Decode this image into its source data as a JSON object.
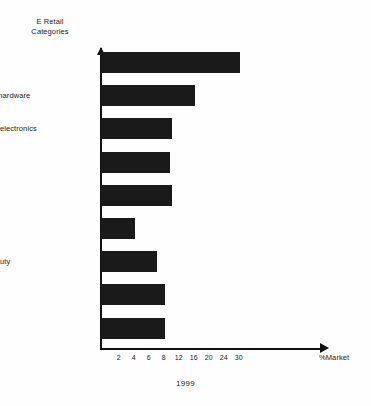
{
  "chart_data": {
    "type": "bar",
    "orientation": "horizontal",
    "title": "",
    "caption": "1999",
    "ylabel": "E Retail Categories",
    "ylabel_lines": [
      "E Retail",
      "Categories"
    ],
    "xlabel": "%Market",
    "categories": [
      "air tickets",
      "computer hardware",
      "consumer electronics",
      "apparel",
      "books",
      "food/bev",
      "health/beauty",
      "music",
      "software"
    ],
    "values": [
      30,
      16,
      10,
      9.5,
      10,
      4,
      7,
      8,
      8
    ],
    "xticks": [
      2,
      4,
      6,
      8,
      12,
      16,
      20,
      24,
      30
    ],
    "xtick_labels": [
      "2",
      "4",
      "6",
      "8",
      "12",
      "16",
      "20",
      "24",
      "30"
    ],
    "xlim": [
      0,
      32
    ],
    "grid": false,
    "legend": false,
    "bar_color": "#1a1a1a",
    "axis_color": "#111111",
    "background": "#ffffff"
  },
  "axis_notes": {
    "tick_spacing_px": 15,
    "first_tick_offset_px": 18.7,
    "note": "tick labels are evenly spaced on the drawing though their numeric values are not uniformly stepped"
  }
}
